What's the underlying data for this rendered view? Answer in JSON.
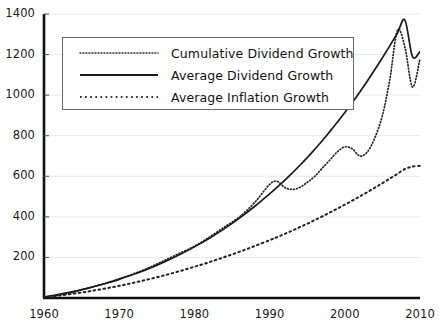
{
  "chart_data": {
    "type": "line",
    "title": "",
    "subtitle": "",
    "xlabel": "",
    "ylabel": "",
    "xlim": [
      1960,
      2010
    ],
    "ylim": [
      0,
      1400
    ],
    "grid": true,
    "legend_position": "top-left",
    "x_ticks": [
      "1960",
      "1970",
      "1980",
      "1990",
      "2000",
      "2010"
    ],
    "x_tick_values": [
      1960,
      1970,
      1980,
      1990,
      2000,
      2010
    ],
    "y_ticks": [
      "200",
      "400",
      "600",
      "800",
      "1000",
      "1200",
      "1400"
    ],
    "y_tick_values": [
      200,
      400,
      600,
      800,
      1000,
      1200,
      1400
    ],
    "x": [
      1960,
      1962,
      1964,
      1966,
      1968,
      1970,
      1972,
      1974,
      1976,
      1978,
      1980,
      1982,
      1984,
      1986,
      1988,
      1990,
      1991,
      1992,
      1993,
      1994,
      1995,
      1996,
      1997,
      1998,
      1999,
      2000,
      2001,
      2002,
      2003,
      2004,
      2005,
      2006,
      2007,
      2008,
      2009,
      2010
    ],
    "series": [
      {
        "name": "Cumulative Dividend Growth",
        "style": "fine-dotted",
        "color": "#222222",
        "values": [
          5,
          15,
          30,
          50,
          70,
          95,
          120,
          150,
          185,
          220,
          255,
          300,
          350,
          400,
          470,
          560,
          575,
          545,
          535,
          545,
          570,
          600,
          640,
          680,
          720,
          745,
          735,
          700,
          720,
          790,
          900,
          1080,
          1320,
          1235,
          1040,
          1180
        ]
      },
      {
        "name": "Average Dividend Growth",
        "style": "solid",
        "color": "#1a1a1a",
        "values": [
          5,
          18,
          33,
          50,
          70,
          92,
          118,
          146,
          178,
          213,
          252,
          295,
          342,
          394,
          451,
          513,
          546,
          580,
          616,
          653,
          692,
          733,
          775,
          820,
          866,
          914,
          964,
          1016,
          1070,
          1126,
          1184,
          1244,
          1306,
          1370,
          1190,
          1215
        ]
      },
      {
        "name": "Average Inflation Growth",
        "style": "coarse-dotted",
        "color": "#222222",
        "values": [
          4,
          12,
          22,
          33,
          46,
          60,
          76,
          93,
          112,
          132,
          154,
          177,
          202,
          228,
          256,
          285,
          300,
          316,
          332,
          349,
          366,
          384,
          402,
          421,
          440,
          460,
          480,
          501,
          522,
          544,
          566,
          589,
          612,
          636,
          648,
          652
        ]
      }
    ],
    "annotations": []
  },
  "legend": {
    "items": [
      {
        "label": "Cumulative Dividend Growth"
      },
      {
        "label": "Average Dividend Growth"
      },
      {
        "label": "Average Inflation Growth"
      }
    ]
  }
}
